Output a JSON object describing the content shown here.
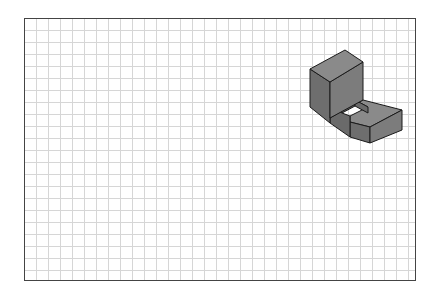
{
  "diagram": {
    "type": "isometric-grid-drawing",
    "grid": {
      "cell_px": 12,
      "line_color": "#d6d6d6",
      "border_color": "#444444"
    },
    "object": {
      "description": "Isometric view of an L-shaped solid with a tall block and a low U-shaped step containing a rectangular notch",
      "colors": {
        "top_face": "#8a8a8a",
        "left_face": "#6e6e6e",
        "right_face": "#7c7c7c",
        "edge": "#1a1a1a"
      }
    }
  }
}
